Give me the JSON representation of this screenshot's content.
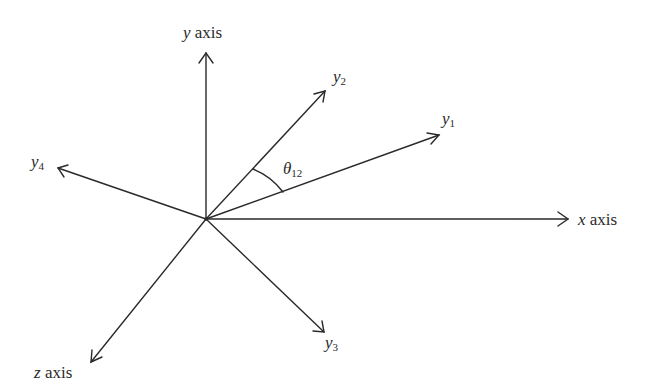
{
  "diagram": {
    "title": "",
    "origin": {
      "x": 206,
      "y": 219
    },
    "stroke_color": "#2a2a2a",
    "vectors": [
      {
        "id": "y-axis",
        "to": {
          "x": 206,
          "y": 52
        },
        "label_var": "y",
        "label_text": "axis",
        "sub": ""
      },
      {
        "id": "x-axis",
        "to": {
          "x": 569,
          "y": 219
        },
        "label_var": "x",
        "label_text": "axis",
        "sub": ""
      },
      {
        "id": "z-axis",
        "to": {
          "x": 90,
          "y": 363
        },
        "label_var": "z",
        "label_text": "axis",
        "sub": ""
      },
      {
        "id": "y1",
        "to": {
          "x": 440,
          "y": 135
        },
        "label_var": "y",
        "label_text": "",
        "sub": "1"
      },
      {
        "id": "y2",
        "to": {
          "x": 326,
          "y": 90
        },
        "label_var": "y",
        "label_text": "",
        "sub": "2"
      },
      {
        "id": "y3",
        "to": {
          "x": 325,
          "y": 333
        },
        "label_var": "y",
        "label_text": "",
        "sub": "3"
      },
      {
        "id": "y4",
        "to": {
          "x": 57,
          "y": 168
        },
        "label_var": "y",
        "label_text": "",
        "sub": "4"
      }
    ],
    "angle": {
      "between": [
        "y1",
        "y2"
      ],
      "label_var": "θ",
      "sub": "12"
    }
  }
}
